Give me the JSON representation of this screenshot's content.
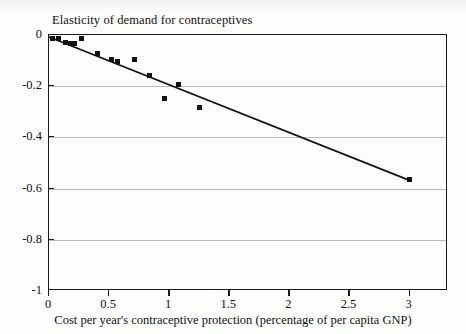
{
  "chart_data": {
    "type": "scatter",
    "title": "Elasticity of demand for contraceptives",
    "xlabel": "Cost per year's contraceptive protection (percentage of per capita GNP)",
    "ylabel": "",
    "xlim": [
      0,
      3.32
    ],
    "ylim": [
      -1,
      0
    ],
    "xticks": [
      0,
      0.5,
      1,
      1.5,
      2,
      2.5,
      3
    ],
    "xtick_labels": [
      "0",
      "0.5",
      "1",
      "1.5",
      "2",
      "2.5",
      "3"
    ],
    "yticks": [
      0,
      -0.2,
      -0.4,
      -0.6,
      -0.8,
      -1
    ],
    "ytick_labels": [
      "0",
      "-0.2",
      "-0.4",
      "-0.6",
      "-0.8",
      "-1"
    ],
    "grid": "horizontal",
    "legend": "none",
    "marker_style": "filled-square",
    "marker_color": "#121212",
    "points": [
      {
        "x": 0.03,
        "y": -0.012
      },
      {
        "x": 0.08,
        "y": -0.012
      },
      {
        "x": 0.14,
        "y": -0.03
      },
      {
        "x": 0.18,
        "y": -0.032
      },
      {
        "x": 0.21,
        "y": -0.034
      },
      {
        "x": 0.27,
        "y": -0.012
      },
      {
        "x": 0.4,
        "y": -0.072
      },
      {
        "x": 0.52,
        "y": -0.095
      },
      {
        "x": 0.57,
        "y": -0.105
      },
      {
        "x": 0.71,
        "y": -0.097
      },
      {
        "x": 0.84,
        "y": -0.157
      },
      {
        "x": 0.96,
        "y": -0.248
      },
      {
        "x": 1.08,
        "y": -0.193
      },
      {
        "x": 1.25,
        "y": -0.285
      },
      {
        "x": 3.0,
        "y": -0.565
      }
    ],
    "trend_line": {
      "type": "linear-fit",
      "from": {
        "x": 0.0,
        "y": -0.008
      },
      "to": {
        "x": 3.0,
        "y": -0.568
      },
      "color": "#121212"
    }
  }
}
